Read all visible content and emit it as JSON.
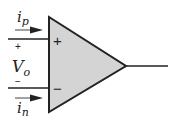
{
  "diagram": {
    "opamp": {
      "fill_color": "#d4d4d4",
      "stroke_color": "#222222",
      "plus_sign": "+",
      "minus_sign": "−"
    },
    "labels": {
      "ip_main": "i",
      "ip_sub": "p",
      "in_main": "i",
      "in_sub": "n",
      "vo_main": "V",
      "vo_sub": "o",
      "vo_plus": "+",
      "vo_minus": "−"
    }
  }
}
